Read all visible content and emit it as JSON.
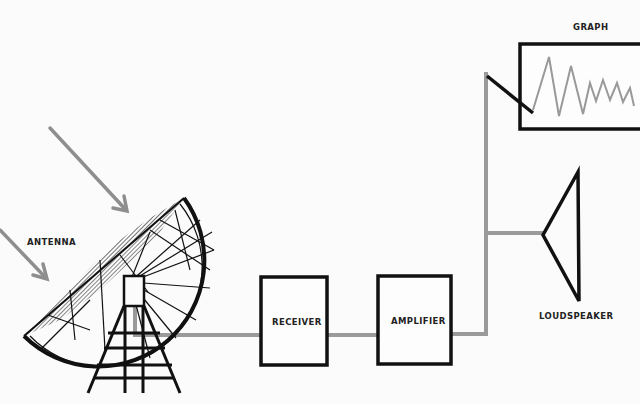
{
  "diagram": {
    "type": "block-diagram",
    "colors": {
      "background": "#fbfbfb",
      "outline": "#111111",
      "signal_line": "#9a9a9a",
      "incoming_waves": "#8e8e8e"
    },
    "labels": {
      "antenna": "ANTENNA",
      "receiver": "RECEIVER",
      "amplifier": "AMPLIFIER",
      "graph": "GRAPH",
      "loudspeaker": "LOUDSPEAKER"
    },
    "nodes": [
      {
        "id": "antenna",
        "label": "ANTENNA",
        "shape": "dish"
      },
      {
        "id": "receiver",
        "label": "RECEIVER",
        "shape": "box"
      },
      {
        "id": "amplifier",
        "label": "AMPLIFIER",
        "shape": "box"
      },
      {
        "id": "graph",
        "label": "GRAPH",
        "shape": "chart-recorder"
      },
      {
        "id": "loudspeaker",
        "label": "LOUDSPEAKER",
        "shape": "cone"
      }
    ],
    "edges": [
      {
        "from": "antenna",
        "to": "receiver"
      },
      {
        "from": "receiver",
        "to": "amplifier"
      },
      {
        "from": "amplifier",
        "to": "graph"
      },
      {
        "from": "amplifier",
        "to": "loudspeaker"
      }
    ],
    "incoming_arrows": 2
  }
}
